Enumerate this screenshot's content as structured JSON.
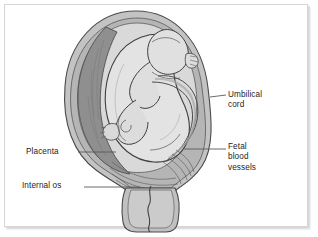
{
  "figure": {
    "style": "grayscale-line-drawing"
  },
  "labels": [
    {
      "id": "umbilical-cord",
      "text": "Umbilical\ncord",
      "lines": [
        "Umbilical",
        "cord"
      ],
      "side": "right",
      "leader": "short-horizontal"
    },
    {
      "id": "fetal-blood-vessels",
      "text": "Fetal\nblood\nvessels",
      "lines": [
        "Fetal",
        "blood",
        "vessels"
      ],
      "side": "right",
      "leader": "long-horizontal"
    },
    {
      "id": "placenta",
      "text": "Placenta",
      "lines": [
        "Placenta"
      ],
      "side": "left",
      "leader": "long-horizontal"
    },
    {
      "id": "internal-os",
      "text": "Internal os",
      "lines": [
        "Internal os"
      ],
      "side": "left",
      "leader": "long-horizontal"
    }
  ],
  "anatomy_parts": [
    {
      "id": "uterine-wall",
      "name": "Uterine wall (myometrium)"
    },
    {
      "id": "placenta-mass",
      "name": "Placenta"
    },
    {
      "id": "amniotic-cavity",
      "name": "Amniotic cavity"
    },
    {
      "id": "fetus",
      "name": "Fetus"
    },
    {
      "id": "umbilical-cord-art",
      "name": "Umbilical cord"
    },
    {
      "id": "fetal-vessels-art",
      "name": "Fetal blood vessels"
    },
    {
      "id": "cervix",
      "name": "Cervix"
    },
    {
      "id": "cervical-canal",
      "name": "Cervical canal / internal os"
    }
  ],
  "colors": {
    "background": "#ffffff",
    "frame_border": "#d6d6d6",
    "outline": "#4a4a4a",
    "outline_dark": "#3a3a3a",
    "uterine_wall": "#c3c3c3",
    "uterine_wall_inner": "#b0b0b0",
    "placenta": "#8f8f8f",
    "amniotic_cavity": "#d9d9d9",
    "fetus_body": "#e3e3e3",
    "fetus_shadow": "#c9c9c9",
    "cord": "#bdbdbd",
    "cervix": "#c0c0c0",
    "label_text": "#1d1d1d",
    "leader_line": "#5a5a5a"
  }
}
